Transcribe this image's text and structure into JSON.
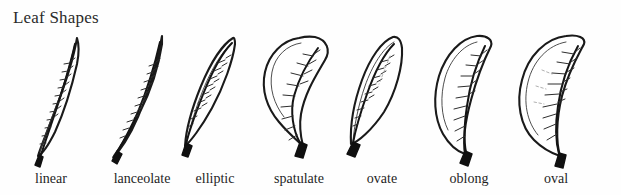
{
  "figure": {
    "title": "Leaf Shapes",
    "background_color": "#fefefe",
    "ink_color": "#1a1a1a",
    "width": 621,
    "height": 195
  },
  "diagram_data": {
    "type": "labeled-illustration",
    "subject": "Leaf Shapes",
    "style": "hand-drawn botanical line art, pinnate venation, dark petiole",
    "item_count": 7,
    "items": [
      {
        "label": "linear",
        "shape": "linear",
        "description": "very narrow, elongated blade with parallel sides tapering to a fine point",
        "center_x": 52,
        "label_x": 51
      },
      {
        "label": "lanceolate",
        "shape": "lanceolate",
        "description": "lance-shaped, broadest below the middle and tapering to a long tip",
        "center_x": 142,
        "label_x": 142
      },
      {
        "label": "elliptic",
        "shape": "elliptic",
        "description": "widest at the middle with tapered base and apex",
        "center_x": 215,
        "label_x": 215
      },
      {
        "label": "spatulate",
        "shape": "spatulate",
        "description": "spoon-shaped, rounded and broad at the apex, narrowing toward the base",
        "center_x": 299,
        "label_x": 299
      },
      {
        "label": "ovate",
        "shape": "ovate",
        "description": "egg-shaped, broadest near the base and tapering to the apex",
        "center_x": 382,
        "label_x": 382
      },
      {
        "label": "oblong",
        "shape": "oblong",
        "description": "sides nearly parallel with rounded base and apex",
        "center_x": 469,
        "label_x": 469
      },
      {
        "label": "oval",
        "shape": "oval",
        "description": "broadly elliptic, widest at the middle with broadly rounded ends",
        "center_x": 556,
        "label_x": 556
      }
    ]
  }
}
